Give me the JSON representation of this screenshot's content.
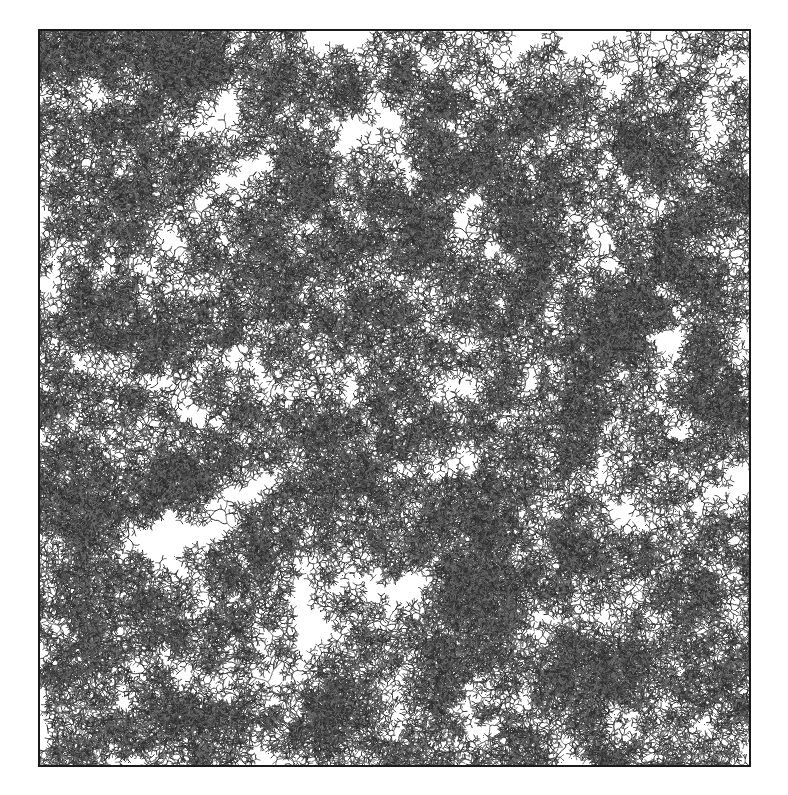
{
  "figure": {
    "kind": "diffusion-limited-aggregation",
    "page": {
      "width": 788,
      "height": 795,
      "background_color": "#ffffff"
    },
    "panel": {
      "x": 38,
      "y": 29,
      "width": 713,
      "height": 738,
      "background_color": "#ffffff",
      "border_color": "#1a1a1a",
      "border_width": 2
    },
    "pattern": {
      "ink_color": "#4a4a4a",
      "ink_color_dark": "#2b2b2b",
      "ink_color_light": "#6e6e6e",
      "branch_width": 1,
      "seed_count": 460,
      "particles_per_seed": 520,
      "step_length": 2.1,
      "turn_jitter": 0.92,
      "branch_probability": 0.3,
      "max_branch_depth": 7,
      "initial_branch_length": 13,
      "length_decay": 0.78,
      "random_seed": 20240917,
      "coverage_fraction": 0.42,
      "edge_margin": 1
    },
    "caption": "",
    "title": ""
  }
}
